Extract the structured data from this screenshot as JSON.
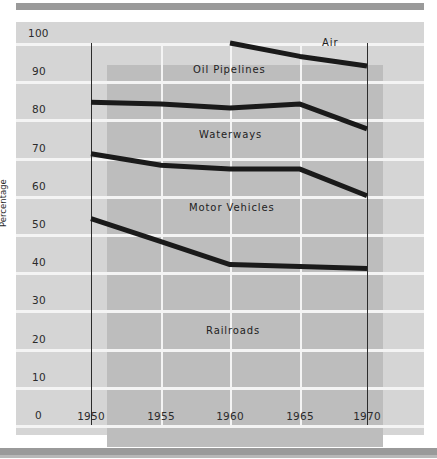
{
  "chart_data": {
    "type": "area",
    "title": "",
    "subtitle": "",
    "xlabel": "",
    "ylabel": "Percentage",
    "x": [
      1950,
      1955,
      1960,
      1965,
      1970
    ],
    "xtick_labels": [
      "1950",
      "1955",
      "1960",
      "1965",
      "1970"
    ],
    "ytick_labels": [
      "0",
      "10",
      "20",
      "30",
      "40",
      "50",
      "60",
      "70",
      "80",
      "90",
      "100"
    ],
    "ylim": [
      0,
      100
    ],
    "xlim": [
      1950,
      1970
    ],
    "grid": true,
    "legend_position": "inline-annotations",
    "stacked": true,
    "note": "Cumulative boundary lines of a 100% stacked area chart; band thicknesses give each mode's share.",
    "boundaries": [
      {
        "name": "Railroads top",
        "values": [
          54,
          48,
          42,
          41.5,
          41
        ]
      },
      {
        "name": "Motor Vehicles top",
        "values": [
          71,
          68,
          67,
          67,
          60
        ]
      },
      {
        "name": "Waterways top",
        "values": [
          84.5,
          84,
          83,
          84,
          77.5
        ]
      },
      {
        "name": "Oil Pipelines top",
        "values": [
          100,
          100,
          100,
          96.5,
          94
        ]
      }
    ],
    "series": [
      {
        "name": "Railroads",
        "values": [
          54,
          48,
          42,
          41.5,
          41
        ]
      },
      {
        "name": "Motor Vehicles",
        "values": [
          17,
          20,
          25,
          25.5,
          19
        ]
      },
      {
        "name": "Waterways",
        "values": [
          13.5,
          16,
          16,
          17,
          17.5
        ]
      },
      {
        "name": "Oil Pipelines",
        "values": [
          15.5,
          16,
          17,
          12.5,
          16.5
        ]
      },
      {
        "name": "Air",
        "values": [
          0,
          0,
          0,
          3.5,
          6
        ]
      }
    ],
    "annotations": [
      {
        "text": "Air",
        "x": 1967,
        "y": 98
      },
      {
        "text": "Oil Pipelines",
        "x": 1958,
        "y": 92
      },
      {
        "text": "Waterways",
        "x": 1958,
        "y": 76
      },
      {
        "text": "Motor  Vehicles",
        "x": 1958,
        "y": 55
      },
      {
        "text": "Railroads",
        "x": 1959,
        "y": 22
      }
    ]
  },
  "axis": {
    "y_title": "Percentage",
    "y_ticks": [
      "100",
      "90",
      "80",
      "70",
      "60",
      "50",
      "40",
      "30",
      "20",
      "10",
      "0"
    ],
    "x_ticks": [
      "1950",
      "1955",
      "1960",
      "1965",
      "1970"
    ]
  },
  "labels": {
    "air": "Air",
    "oil_pipelines": "Oil Pipelines",
    "waterways": "Waterways",
    "motor_vehicles": "Motor  Vehicles",
    "railroads": "Railroads"
  },
  "colors": {
    "page_background": "#ffffff",
    "panel_background": "#d5d5d5",
    "plot_background": "#bdbdbd",
    "gridline": "#f4f4f4",
    "line": "#1a1a1a",
    "rule": "#9a9a9a",
    "text": "#2b2b2b"
  }
}
